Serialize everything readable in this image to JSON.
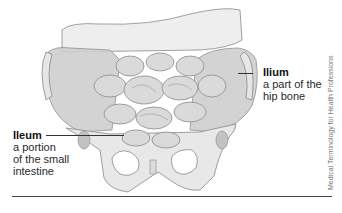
{
  "labels": {
    "ilium": {
      "term": "Ilium",
      "description_lines": [
        "a part of the",
        "hip bone"
      ]
    },
    "ileum": {
      "term": "Ileum",
      "description_lines": [
        "a portion",
        "of the small",
        "intestine"
      ]
    }
  },
  "credit": "Medical Terminology for Health Professions",
  "colors": {
    "bone": "#e4e4e4",
    "bone_shadow": "#c9c9c9",
    "intestine": "#d6d6d6",
    "outline": "#777777",
    "text": "#222222"
  }
}
